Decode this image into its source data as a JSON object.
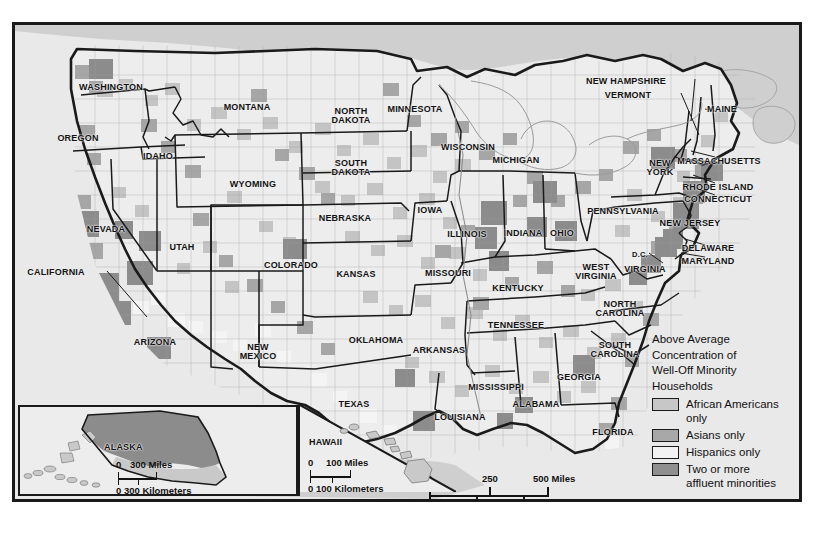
{
  "map": {
    "title_note": "United States county map of above-average concentration of well-off minority households",
    "frame_color": "#1a1a1a",
    "ocean_color": "#e9e9e9",
    "land_base_color": "#ededed",
    "canada_color": "#cfcfcf",
    "state_border_color": "#1a1a1a",
    "county_border_color": "#8d8d8d"
  },
  "legend": {
    "title_lines": [
      "Above Average",
      "Concentration of",
      "Well-Off Minority",
      "Households"
    ],
    "entries": [
      {
        "label": "African Americans\nonly",
        "color": "#c7c7c7",
        "key": "african-americans-only"
      },
      {
        "label": "Asians only",
        "color": "#a8a8a8",
        "key": "asians-only"
      },
      {
        "label": "Hispanics only",
        "color": "#f2f2f2",
        "key": "hispanics-only"
      },
      {
        "label": "Two or more\naffluent minorities",
        "color": "#8f8f8f",
        "key": "two-or-more-affluent-minorities"
      }
    ]
  },
  "scales": {
    "main": {
      "miles_ticks": [
        "0",
        "250",
        "500 Miles"
      ],
      "km_ticks": [
        "0",
        "250",
        "500 Kilometers"
      ]
    },
    "alaska": {
      "miles_ticks": [
        "0",
        "300 Miles"
      ],
      "km_ticks": [
        "0 300 Kilometers"
      ]
    },
    "hawaii": {
      "miles_ticks": [
        "0",
        "100 Miles"
      ],
      "km_ticks": [
        "0 100 Kilometers"
      ]
    }
  },
  "insets": {
    "alaska_label": "ALASKA",
    "hawaii_label": "HAWAII"
  },
  "state_labels": [
    {
      "name": "WASHINGTON",
      "x": 96,
      "y": 58,
      "size": "s9",
      "lines": [
        "WASHINGTON"
      ]
    },
    {
      "name": "OREGON",
      "x": 63,
      "y": 109,
      "size": "s9",
      "lines": [
        "OREGON"
      ]
    },
    {
      "name": "IDAHO",
      "x": 143,
      "y": 127,
      "size": "s9",
      "lines": [
        "IDAHO"
      ]
    },
    {
      "name": "MONTANA",
      "x": 232,
      "y": 78,
      "size": "s9",
      "lines": [
        "MONTANA"
      ]
    },
    {
      "name": "WYOMING",
      "x": 238,
      "y": 155,
      "size": "s9",
      "lines": [
        "WYOMING"
      ]
    },
    {
      "name": "NEVADA",
      "x": 91,
      "y": 200,
      "size": "s9",
      "lines": [
        "NEVADA"
      ]
    },
    {
      "name": "CALIFORNIA",
      "x": 41,
      "y": 243,
      "size": "s9",
      "lines": [
        "CALIFORNIA"
      ]
    },
    {
      "name": "UTAH",
      "x": 167,
      "y": 218,
      "size": "s9",
      "lines": [
        "UTAH"
      ]
    },
    {
      "name": "ARIZONA",
      "x": 140,
      "y": 313,
      "size": "s9",
      "lines": [
        "ARIZONA"
      ]
    },
    {
      "name": "NEW MEXICO",
      "x": 243,
      "y": 318,
      "size": "s9",
      "lines": [
        "NEW",
        "MEXICO"
      ]
    },
    {
      "name": "COLORADO",
      "x": 276,
      "y": 236,
      "size": "s9",
      "lines": [
        "COLORADO"
      ]
    },
    {
      "name": "NORTH DAKOTA",
      "x": 336,
      "y": 82,
      "size": "s9",
      "lines": [
        "NORTH",
        "DAKOTA"
      ]
    },
    {
      "name": "SOUTH DAKOTA",
      "x": 336,
      "y": 134,
      "size": "s9",
      "lines": [
        "SOUTH",
        "DAKOTA"
      ]
    },
    {
      "name": "NEBRASKA",
      "x": 330,
      "y": 189,
      "size": "s9",
      "lines": [
        "NEBRASKA"
      ]
    },
    {
      "name": "KANSAS",
      "x": 341,
      "y": 245,
      "size": "s9",
      "lines": [
        "KANSAS"
      ]
    },
    {
      "name": "OKLAHOMA",
      "x": 361,
      "y": 311,
      "size": "s9",
      "lines": [
        "OKLAHOMA"
      ]
    },
    {
      "name": "TEXAS",
      "x": 339,
      "y": 375,
      "size": "s9",
      "lines": [
        "TEXAS"
      ]
    },
    {
      "name": "MINNESOTA",
      "x": 400,
      "y": 80,
      "size": "s9",
      "lines": [
        "MINNESOTA"
      ]
    },
    {
      "name": "IOWA",
      "x": 415,
      "y": 181,
      "size": "s9",
      "lines": [
        "IOWA"
      ]
    },
    {
      "name": "MISSOURI",
      "x": 433,
      "y": 244,
      "size": "s9",
      "lines": [
        "MISSOURI"
      ]
    },
    {
      "name": "ARKANSAS",
      "x": 424,
      "y": 321,
      "size": "s9",
      "lines": [
        "ARKANSAS"
      ]
    },
    {
      "name": "LOUISIANA",
      "x": 445,
      "y": 388,
      "size": "s9",
      "lines": [
        "LOUISIANA"
      ]
    },
    {
      "name": "WISCONSIN",
      "x": 453,
      "y": 118,
      "size": "s9",
      "lines": [
        "WISCONSIN"
      ]
    },
    {
      "name": "ILLINESS",
      "x": 452,
      "y": 205,
      "size": "s9",
      "lines": [
        "ILLINOIS"
      ]
    },
    {
      "name": "MICHIGAN",
      "x": 501,
      "y": 131,
      "size": "s9",
      "lines": [
        "MICHIGAN"
      ]
    },
    {
      "name": "INDIANA",
      "x": 508,
      "y": 204,
      "size": "s9",
      "lines": [
        "INDIANA"
      ]
    },
    {
      "name": "OHIO",
      "x": 547,
      "y": 204,
      "size": "s9",
      "lines": [
        "OHIO"
      ]
    },
    {
      "name": "KENTUCKY",
      "x": 503,
      "y": 259,
      "size": "s9",
      "lines": [
        "KENTUCKY"
      ]
    },
    {
      "name": "TENNESSEE",
      "x": 501,
      "y": 296,
      "size": "s9",
      "lines": [
        "TENNESSEE"
      ]
    },
    {
      "name": "MISSISSIPPI",
      "x": 481,
      "y": 358,
      "size": "s9",
      "lines": [
        "MISSISSIPPI"
      ]
    },
    {
      "name": "ALABAMA",
      "x": 521,
      "y": 375,
      "size": "s9",
      "lines": [
        "ALABAMA"
      ]
    },
    {
      "name": "GEORGIA",
      "x": 564,
      "y": 348,
      "size": "s9",
      "lines": [
        "GEORGIA"
      ]
    },
    {
      "name": "FLORIDA",
      "x": 598,
      "y": 403,
      "size": "s9",
      "lines": [
        "FLORIDA"
      ]
    },
    {
      "name": "SOUTH CAROLINA",
      "x": 600,
      "y": 316,
      "size": "s9",
      "lines": [
        "SOUTH",
        "CAROLINA"
      ]
    },
    {
      "name": "NORTH CAROLINA",
      "x": 605,
      "y": 275,
      "size": "s9",
      "lines": [
        "NORTH",
        "CAROLINA"
      ]
    },
    {
      "name": "WEST VIRGINIA",
      "x": 581,
      "y": 238,
      "size": "s9",
      "lines": [
        "WEST",
        "VIRGINIA"
      ]
    },
    {
      "name": "VIRGINIA",
      "x": 630,
      "y": 240,
      "size": "s9",
      "lines": [
        "VIRGINIA"
      ]
    },
    {
      "name": "D.C.",
      "x": 625,
      "y": 226,
      "size": "s75",
      "lines": [
        "D.C."
      ]
    },
    {
      "name": "PENNSYLVANIA",
      "x": 608,
      "y": 182,
      "size": "s9",
      "lines": [
        "PENNSYLVANIA"
      ]
    },
    {
      "name": "NEW YORK",
      "x": 645,
      "y": 134,
      "size": "s9",
      "lines": [
        "NEW",
        "YORK"
      ]
    },
    {
      "name": "MAINE",
      "x": 707,
      "y": 80,
      "size": "s9",
      "lines": [
        "MAINE"
      ]
    },
    {
      "name": "NEW HAMPSHIRE",
      "x": 611,
      "y": 52,
      "size": "s9",
      "lines": [
        "NEW HAMPSHIRE"
      ]
    },
    {
      "name": "VERMONT",
      "x": 613,
      "y": 66,
      "size": "s9",
      "lines": [
        "VERMONT"
      ]
    },
    {
      "name": "MASSACHUSETTS",
      "x": 704,
      "y": 132,
      "size": "s9",
      "lines": [
        "MASSACHUSETTS"
      ]
    },
    {
      "name": "RHODE ISLAND",
      "x": 703,
      "y": 158,
      "size": "s9",
      "lines": [
        "RHODE ISLAND"
      ]
    },
    {
      "name": "CONNECTICUT",
      "x": 703,
      "y": 170,
      "size": "s9",
      "lines": [
        "CONNECTICUT"
      ]
    },
    {
      "name": "NEW JERSEY",
      "x": 675,
      "y": 194,
      "size": "s9",
      "lines": [
        "NEW JERSEY"
      ]
    },
    {
      "name": "DELAWARE",
      "x": 693,
      "y": 219,
      "size": "s9",
      "lines": [
        "DELAWARE"
      ]
    },
    {
      "name": "MARYLAND",
      "x": 693,
      "y": 232,
      "size": "s9",
      "lines": [
        "MARYLAND"
      ]
    }
  ]
}
